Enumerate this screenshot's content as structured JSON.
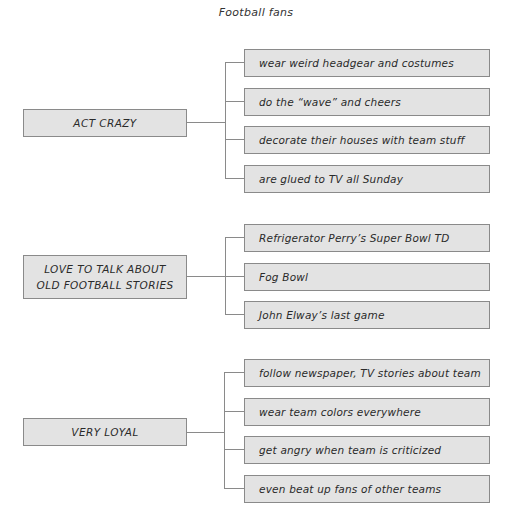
{
  "title": "Football fans",
  "groups": [
    {
      "label": "ACT CRAZY",
      "items": [
        "wear weird headgear and costumes",
        "do the “wave” and cheers",
        "decorate their houses with team stuff",
        "are glued to TV all Sunday"
      ]
    },
    {
      "label": "LOVE TO TALK ABOUT OLD FOOTBALL STORIES",
      "label_lines": [
        "LOVE TO TALK ABOUT",
        "OLD FOOTBALL STORIES"
      ],
      "items": [
        "Refrigerator Perry’s Super Bowl TD",
        "Fog Bowl",
        "John Elway’s last game"
      ]
    },
    {
      "label": "VERY LOYAL",
      "items": [
        "follow newspaper, TV stories about team",
        "wear team colors everywhere",
        "get angry when team is criticized",
        "even beat up fans of other teams"
      ]
    }
  ],
  "colors": {
    "box_fill": "#e3e3e3",
    "box_border": "#8a8a8a",
    "line": "#8a8a8a",
    "text": "#2a2a2a"
  }
}
